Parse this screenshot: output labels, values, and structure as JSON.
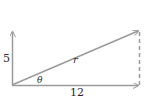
{
  "diagram": {
    "labels": {
      "vertical": "5",
      "horizontal": "12",
      "hypotenuse": "r",
      "angle": "θ"
    },
    "colors": {
      "line": "#9a9a9a",
      "text": "#2a2a2a"
    }
  }
}
